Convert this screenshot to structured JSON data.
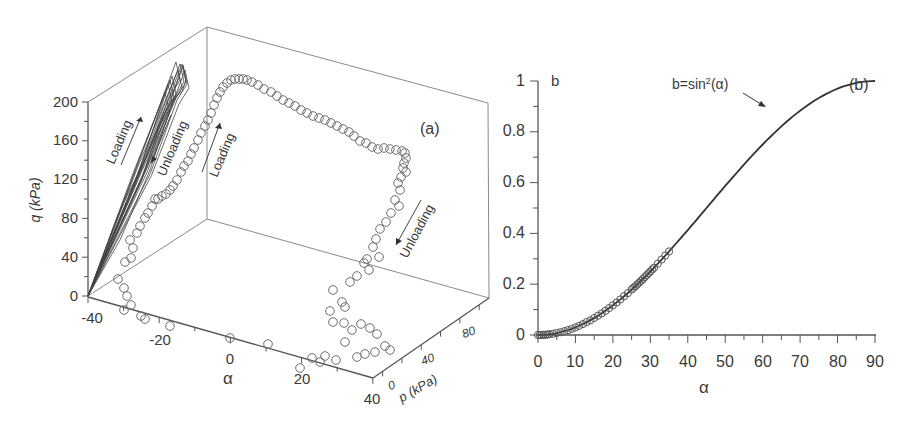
{
  "chart_data": [
    {
      "id": "a",
      "type": "scatter3d",
      "panel_label": "(a)",
      "title": "",
      "axes": {
        "x": {
          "label": "α",
          "ticks": [
            -40,
            -20,
            0,
            20,
            40
          ],
          "range": [
            -40,
            40
          ]
        },
        "y": {
          "label": "p (kPa)",
          "ticks": [
            0,
            40,
            80
          ],
          "range": [
            -20,
            100
          ]
        },
        "z": {
          "label": "q (kPa)",
          "ticks": [
            0,
            40,
            80,
            120,
            160,
            200
          ],
          "range": [
            0,
            200
          ]
        }
      },
      "annotations": [
        {
          "text": "Loading",
          "where": "along stress path on back wall (left trajectory), arrow up"
        },
        {
          "text": "Unloading",
          "where": "along stress path on back wall (left trajectory), arrow down"
        },
        {
          "text": "Loading",
          "where": "ascending branch of circles, arrow up"
        },
        {
          "text": "Unloading",
          "where": "descending branch of circles near right, arrow down-left"
        }
      ],
      "series": [
        {
          "name": "q-p stress path projection (lines)",
          "style": "line",
          "description": "Bundle of near-linear loading/unloading cycles from q=0 up to q≈200 kPa, projected on the α=-40 wall"
        },
        {
          "name": "measured states (circles)",
          "style": "open-circle",
          "projected_points_px": [
            [
              124,
              310
            ],
            [
              131,
              305
            ],
            [
              141,
              316
            ],
            [
              145,
              319
            ],
            [
              170,
              326
            ],
            [
              118,
              279
            ],
            [
              124,
              288
            ],
            [
              127,
              296
            ],
            [
              125,
              262
            ],
            [
              131,
              258
            ],
            [
              130,
              240
            ],
            [
              133,
              248
            ],
            [
              137,
              233
            ],
            [
              140,
              226
            ],
            [
              145,
              218
            ],
            [
              148,
              213
            ],
            [
              152,
              206
            ],
            [
              155,
              199
            ],
            [
              158,
              199
            ],
            [
              162,
              196
            ],
            [
              166,
              194
            ],
            [
              170,
              190
            ],
            [
              173,
              186
            ],
            [
              177,
              180
            ],
            [
              181,
              172
            ],
            [
              184,
              166
            ],
            [
              188,
              161
            ],
            [
              191,
              154
            ],
            [
              194,
              148
            ],
            [
              198,
              140
            ],
            [
              201,
              133
            ],
            [
              205,
              126
            ],
            [
              208,
              120
            ],
            [
              211,
              113
            ],
            [
              214,
              105
            ],
            [
              217,
              98
            ],
            [
              220,
              92
            ],
            [
              223,
              87
            ],
            [
              227,
              83
            ],
            [
              231,
              80
            ],
            [
              235,
              79
            ],
            [
              239,
              79
            ],
            [
              243,
              79
            ],
            [
              247,
              80
            ],
            [
              252,
              82
            ],
            [
              258,
              85
            ],
            [
              264,
              89
            ],
            [
              271,
              92
            ],
            [
              277,
              96
            ],
            [
              283,
              100
            ],
            [
              289,
              103
            ],
            [
              295,
              106
            ],
            [
              301,
              110
            ],
            [
              307,
              113
            ],
            [
              313,
              116
            ],
            [
              319,
              118
            ],
            [
              325,
              120
            ],
            [
              331,
              123
            ],
            [
              337,
              126
            ],
            [
              343,
              129
            ],
            [
              349,
              132
            ],
            [
              354,
              136
            ],
            [
              360,
              141
            ],
            [
              366,
              143
            ],
            [
              372,
              147
            ],
            [
              378,
              149
            ],
            [
              384,
              148
            ],
            [
              390,
              149
            ],
            [
              396,
              150
            ],
            [
              402,
              151
            ],
            [
              405,
              153
            ],
            [
              406,
              158
            ],
            [
              404,
              163
            ],
            [
              403,
              168
            ],
            [
              406,
              172
            ],
            [
              401,
              177
            ],
            [
              398,
              183
            ],
            [
              400,
              190
            ],
            [
              395,
              200
            ],
            [
              399,
              206
            ],
            [
              391,
              213
            ],
            [
              386,
              222
            ],
            [
              380,
              229
            ],
            [
              376,
              239
            ],
            [
              373,
              247
            ],
            [
              367,
              259
            ],
            [
              379,
              257
            ],
            [
              364,
              263
            ],
            [
              369,
              270
            ],
            [
              357,
              276
            ],
            [
              350,
              282
            ],
            [
              333,
              290
            ],
            [
              342,
              302
            ],
            [
              330,
              311
            ],
            [
              345,
              307
            ],
            [
              333,
              322
            ],
            [
              344,
              323
            ],
            [
              352,
              330
            ],
            [
              361,
              324
            ],
            [
              370,
              328
            ],
            [
              377,
              334
            ],
            [
              385,
              346
            ],
            [
              345,
              342
            ],
            [
              357,
              357
            ],
            [
              365,
              354
            ],
            [
              375,
              352
            ],
            [
              390,
              350
            ],
            [
              325,
              356
            ],
            [
              320,
              362
            ],
            [
              336,
              360
            ],
            [
              312,
              358
            ],
            [
              300,
              368
            ],
            [
              268,
              344
            ],
            [
              230,
              338
            ]
          ]
        }
      ],
      "layout": {
        "grid": false,
        "legend": "none",
        "box": true
      }
    },
    {
      "id": "b",
      "type": "line+scatter",
      "panel_label": "(b)",
      "title": "",
      "xlabel": "α",
      "ylabel": "b",
      "xlim": [
        0,
        90
      ],
      "ylim": [
        0,
        1
      ],
      "x_ticks": [
        0,
        10,
        20,
        30,
        40,
        50,
        60,
        70,
        80,
        90
      ],
      "y_ticks": [
        0,
        0.2,
        0.4,
        0.6,
        0.8,
        1
      ],
      "y_tick_labels": [
        "0",
        "0.2",
        "0.4",
        "0.6",
        "0.8",
        "1"
      ],
      "annotations": [
        {
          "text": "b=sin²(α)",
          "points_to": [
            61,
            0.77
          ]
        }
      ],
      "series": [
        {
          "name": "b=sin²(α)",
          "style": "line",
          "x": [
            0,
            5,
            10,
            15,
            20,
            25,
            30,
            35,
            40,
            45,
            50,
            55,
            60,
            65,
            70,
            75,
            80,
            85,
            90
          ],
          "y": [
            0,
            0.008,
            0.03,
            0.067,
            0.117,
            0.179,
            0.25,
            0.329,
            0.413,
            0.5,
            0.587,
            0.671,
            0.75,
            0.821,
            0.883,
            0.933,
            0.97,
            0.992,
            1.0
          ]
        },
        {
          "name": "measured",
          "style": "open-circle",
          "x": [
            0,
            0.5,
            1,
            1.5,
            2,
            2.5,
            3,
            4,
            5,
            6,
            7,
            8,
            9,
            10,
            11,
            12,
            13,
            14,
            15,
            16,
            17,
            18,
            19,
            20,
            21,
            22,
            23,
            24,
            25,
            25.5,
            26,
            26.5,
            27,
            27.5,
            28,
            28.5,
            29,
            29.5,
            30,
            30.5,
            31,
            32,
            33,
            34,
            35
          ],
          "y": [
            0,
            0,
            0,
            0.001,
            0.001,
            0.002,
            0.003,
            0.005,
            0.008,
            0.011,
            0.015,
            0.019,
            0.024,
            0.03,
            0.036,
            0.043,
            0.051,
            0.058,
            0.067,
            0.076,
            0.085,
            0.095,
            0.106,
            0.117,
            0.128,
            0.14,
            0.153,
            0.165,
            0.179,
            0.186,
            0.192,
            0.199,
            0.206,
            0.213,
            0.22,
            0.228,
            0.235,
            0.243,
            0.25,
            0.258,
            0.265,
            0.281,
            0.297,
            0.313,
            0.329
          ]
        }
      ],
      "layout": {
        "grid": false,
        "legend": "none"
      }
    }
  ],
  "panel_a": {
    "label": "(a)",
    "z_axis_title": "q (kPa)",
    "x_axis_title": "α",
    "y_axis_title": "p (kPa)",
    "z_ticks": [
      "0",
      "40",
      "80",
      "120",
      "160",
      "200"
    ],
    "x_ticks": [
      "-40",
      "-20",
      "0",
      "20",
      "40"
    ],
    "y_ticks": [
      "0",
      "40",
      "80"
    ],
    "annot_loading_1": "Loading",
    "annot_unloading_1": "Unloading",
    "annot_loading_2": "Loading",
    "annot_unloading_2": "Unloading"
  },
  "panel_b": {
    "label": "(b)",
    "y_axis_title": "b",
    "x_axis_title": "α",
    "curve_label_main": "b=sin",
    "curve_label_sup": "2",
    "curve_label_end": "(α)",
    "x_ticks": [
      "0",
      "10",
      "20",
      "30",
      "40",
      "50",
      "60",
      "70",
      "80",
      "90"
    ],
    "y_ticks": [
      "0",
      "0.2",
      "0.4",
      "0.6",
      "0.8",
      "1"
    ]
  }
}
